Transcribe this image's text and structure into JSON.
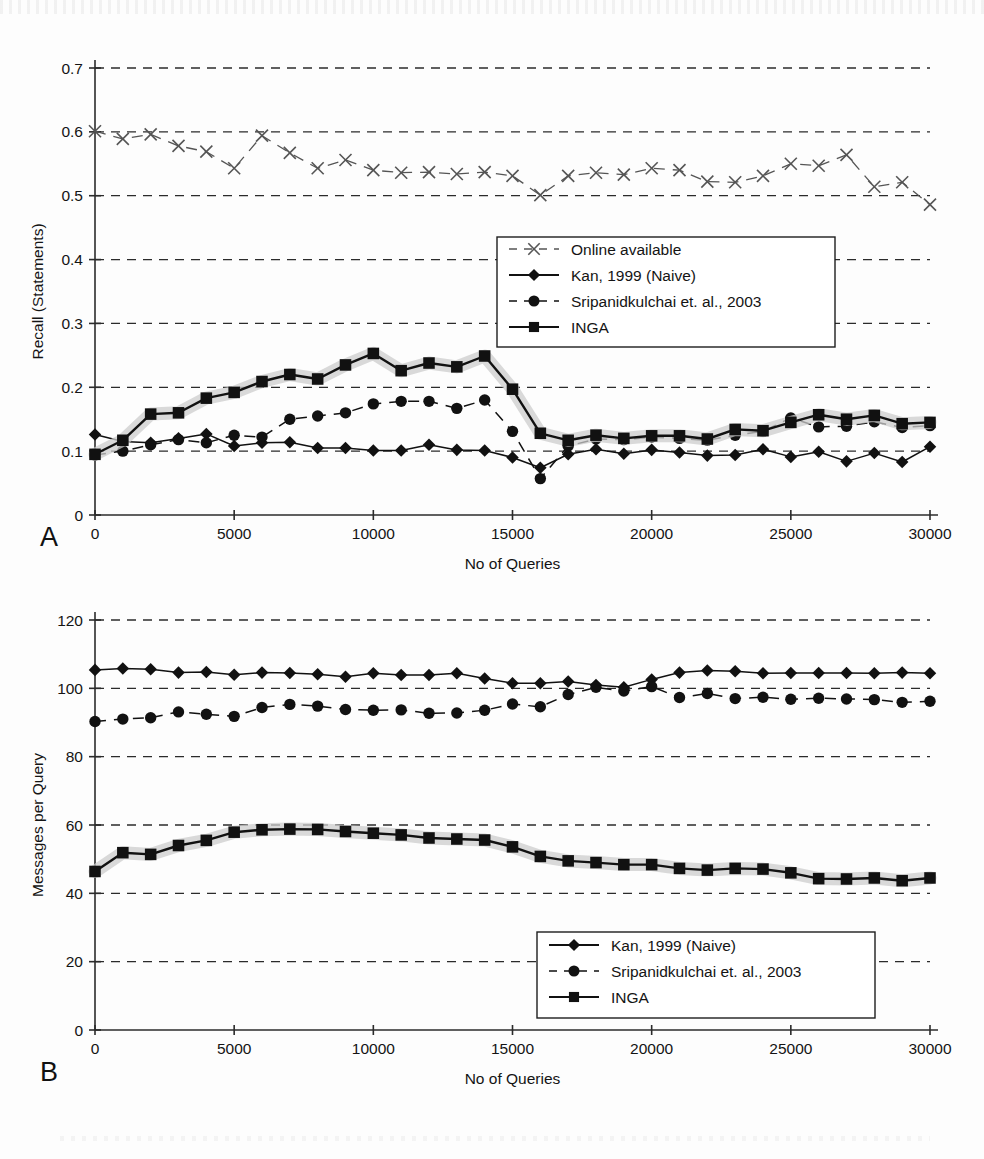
{
  "figure": {
    "panel_a_letter": "A",
    "panel_b_letter": "B"
  },
  "chart_data": [
    {
      "id": "panel-a",
      "type": "line",
      "title": "",
      "xlabel": "No of Queries",
      "ylabel": "Recall (Statements)",
      "xlim": [
        0,
        30000
      ],
      "ylim": [
        0,
        0.7
      ],
      "xticks": [
        0,
        5000,
        10000,
        15000,
        20000,
        25000,
        30000
      ],
      "xtick_labels": [
        "0",
        "5000",
        "10000",
        "15000",
        "20000",
        "25000",
        "30000"
      ],
      "yticks": [
        0,
        0.1,
        0.2,
        0.3,
        0.4,
        0.5,
        0.6,
        0.7
      ],
      "ytick_labels": [
        "0",
        "0.1",
        "0.2",
        "0.3",
        "0.4",
        "0.5",
        "0.6",
        "0.7"
      ],
      "grid": "horizontal-dashed",
      "legend_position": "upper-right-inset",
      "x": [
        0,
        1000,
        2000,
        3000,
        4000,
        5000,
        6000,
        7000,
        8000,
        9000,
        10000,
        11000,
        12000,
        13000,
        14000,
        15000,
        16000,
        17000,
        18000,
        19000,
        20000,
        21000,
        22000,
        23000,
        24000,
        25000,
        26000,
        27000,
        28000,
        29000,
        30000
      ],
      "series": [
        {
          "name": "Online available",
          "marker": "x",
          "linestyle": "dashed",
          "color": "#555555",
          "values": [
            0.601,
            0.589,
            0.596,
            0.578,
            0.569,
            0.543,
            0.594,
            0.567,
            0.543,
            0.556,
            0.54,
            0.536,
            0.537,
            0.534,
            0.537,
            0.531,
            0.501,
            0.531,
            0.536,
            0.533,
            0.543,
            0.54,
            0.522,
            0.521,
            0.531,
            0.55,
            0.547,
            0.564,
            0.514,
            0.521,
            0.486,
            0.493
          ]
        },
        {
          "name": "Kan, 1999 (Naive)",
          "marker": "diamond",
          "linestyle": "solid",
          "color": "#111111",
          "values": [
            0.126,
            0.115,
            0.113,
            0.12,
            0.127,
            0.108,
            0.113,
            0.114,
            0.105,
            0.105,
            0.101,
            0.101,
            0.11,
            0.102,
            0.101,
            0.09,
            0.074,
            0.095,
            0.103,
            0.096,
            0.102,
            0.098,
            0.093,
            0.094,
            0.103,
            0.091,
            0.099,
            0.084,
            0.097,
            0.083,
            0.107
          ]
        },
        {
          "name": "Sripanidkulchai et. al., 2003",
          "marker": "circle",
          "linestyle": "dashed",
          "color": "#111111",
          "values": [
            0.094,
            0.1,
            0.11,
            0.118,
            0.113,
            0.125,
            0.122,
            0.15,
            0.155,
            0.16,
            0.174,
            0.178,
            0.178,
            0.167,
            0.18,
            0.131,
            0.057,
            0.108,
            0.119,
            0.118,
            0.122,
            0.12,
            0.117,
            0.125,
            0.131,
            0.152,
            0.138,
            0.139,
            0.146,
            0.137,
            0.14
          ]
        },
        {
          "name": "INGA",
          "marker": "square",
          "linestyle": "solid-band",
          "color": "#111111",
          "band_color": "#cccccc",
          "values": [
            0.095,
            0.117,
            0.158,
            0.16,
            0.183,
            0.192,
            0.209,
            0.22,
            0.213,
            0.235,
            0.253,
            0.226,
            0.238,
            0.232,
            0.249,
            0.197,
            0.128,
            0.117,
            0.125,
            0.12,
            0.124,
            0.124,
            0.119,
            0.134,
            0.132,
            0.145,
            0.157,
            0.15,
            0.156,
            0.143,
            0.145
          ]
        }
      ]
    },
    {
      "id": "panel-b",
      "type": "line",
      "title": "",
      "xlabel": "No of Queries",
      "ylabel": "Messages per Query",
      "xlim": [
        0,
        30000
      ],
      "ylim": [
        0,
        120
      ],
      "xticks": [
        0,
        5000,
        10000,
        15000,
        20000,
        25000,
        30000
      ],
      "xtick_labels": [
        "0",
        "5000",
        "10000",
        "15000",
        "20000",
        "25000",
        "30000"
      ],
      "yticks": [
        0,
        20,
        40,
        60,
        80,
        100,
        120
      ],
      "ytick_labels": [
        "0",
        "20",
        "40",
        "60",
        "80",
        "100",
        "120"
      ],
      "grid": "horizontal-dashed",
      "legend_position": "lower-right-inset",
      "x": [
        0,
        1000,
        2000,
        3000,
        4000,
        5000,
        6000,
        7000,
        8000,
        9000,
        10000,
        11000,
        12000,
        13000,
        14000,
        15000,
        16000,
        17000,
        18000,
        19000,
        20000,
        21000,
        22000,
        23000,
        24000,
        25000,
        26000,
        27000,
        28000,
        29000,
        30000
      ],
      "series": [
        {
          "name": "Kan, 1999 (Naive)",
          "marker": "diamond",
          "linestyle": "solid",
          "color": "#111111",
          "values": [
            105.4,
            105.8,
            105.6,
            104.6,
            104.8,
            104.0,
            104.6,
            104.5,
            104.1,
            103.4,
            104.4,
            103.9,
            103.9,
            104.4,
            102.9,
            101.5,
            101.5,
            102.0,
            101.0,
            100.3,
            102.6,
            104.6,
            105.2,
            105.0,
            104.4,
            104.5,
            104.5,
            104.5,
            104.4,
            104.6,
            104.4
          ]
        },
        {
          "name": "Sripanidkulchai et. al., 2003",
          "marker": "circle",
          "linestyle": "dashed",
          "color": "#111111",
          "values": [
            90.3,
            91.0,
            91.4,
            93.1,
            92.4,
            91.8,
            94.4,
            95.3,
            94.8,
            93.8,
            93.6,
            93.7,
            92.7,
            92.8,
            93.6,
            95.4,
            94.6,
            98.2,
            100.3,
            99.2,
            100.5,
            97.3,
            98.5,
            97.0,
            97.4,
            96.8,
            97.1,
            96.9,
            96.7,
            95.9,
            96.2
          ]
        },
        {
          "name": "INGA",
          "marker": "square",
          "linestyle": "solid-band",
          "color": "#111111",
          "band_color": "#cccccc",
          "values": [
            46.4,
            51.9,
            51.4,
            54.0,
            55.5,
            57.9,
            58.6,
            58.8,
            58.7,
            58.1,
            57.6,
            57.1,
            56.2,
            55.9,
            55.6,
            53.6,
            50.8,
            49.5,
            49.0,
            48.4,
            48.4,
            47.3,
            46.8,
            47.3,
            47.1,
            46.0,
            44.3,
            44.2,
            44.5,
            43.7,
            44.5
          ]
        }
      ]
    }
  ]
}
